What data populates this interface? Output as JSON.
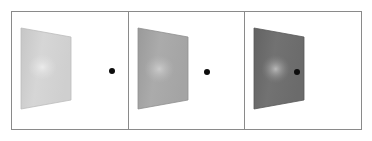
{
  "figure": {
    "background_color": "#ffffff",
    "frame_color": "#8a8a8a",
    "width": 372,
    "height": 141,
    "panel_count": 3
  },
  "panels": [
    {
      "index": 1,
      "surface_label": "light-gray-slanted-surface",
      "surface_base_color": "#d3d3d3",
      "surface_edge_color": "#c2c2c2",
      "surface_highlight_color": "#e8e8e8",
      "dot_label": "black-target-dot",
      "dot_color": "#0d0d0d",
      "dot_diameter_px": 6,
      "relative_luminance": "high"
    },
    {
      "index": 2,
      "surface_label": "medium-gray-slanted-surface",
      "surface_base_color": "#a8a8a8",
      "surface_edge_color": "#949494",
      "surface_highlight_color": "#c9c9c9",
      "dot_label": "black-target-dot",
      "dot_color": "#0d0d0d",
      "dot_diameter_px": 6,
      "relative_luminance": "medium"
    },
    {
      "index": 3,
      "surface_label": "dark-gray-slanted-surface",
      "surface_base_color": "#6e6e6e",
      "surface_edge_color": "#5c5c5c",
      "surface_highlight_color": "#b5b5b5",
      "dot_label": "black-target-dot",
      "dot_color": "#0d0d0d",
      "dot_diameter_px": 6,
      "relative_luminance": "low"
    }
  ],
  "chart_data": {
    "type": "table",
    "title": "",
    "categories": [
      "Panel 1",
      "Panel 2",
      "Panel 3"
    ],
    "series": [
      {
        "name": "Surface gray level (0-255)",
        "values": [
          211,
          168,
          110
        ]
      },
      {
        "name": "Highlight gray level (0-255)",
        "values": [
          232,
          201,
          181
        ]
      }
    ],
    "annotations": [
      "Each panel shows a planar surface in perspective (trapezoid) with a soft luminance gradient and a central bright blob.",
      "A small black dot is placed to the right of each surface.",
      "Surface reflectance decreases from left panel to right panel."
    ],
    "xlabel": "Panel",
    "ylabel": "Gray level",
    "ylim": [
      0,
      255
    ],
    "grid": false,
    "legend_position": "none"
  }
}
